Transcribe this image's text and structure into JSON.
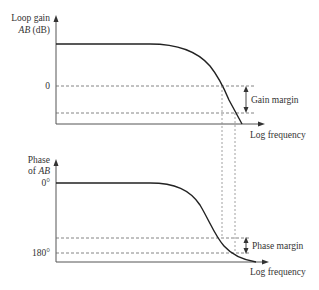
{
  "diagram": {
    "gain_plot": {
      "ylabel_line1": "Loop gain",
      "ylabel_line2_italic": "AB",
      "ylabel_line2_unit": " (dB)",
      "tick_zero": "0",
      "xlabel": "Log frequency",
      "annotation": "Gain margin"
    },
    "phase_plot": {
      "ylabel_line1": "Phase",
      "ylabel_line2_prefix": "of ",
      "ylabel_line2_italic": "AB",
      "tick_zero": "0°",
      "tick_180": "180°",
      "xlabel": "Log frequency",
      "annotation": "Phase margin"
    },
    "colors": {
      "curve": "#222222",
      "axis": "#555555",
      "text": "#333333"
    }
  }
}
